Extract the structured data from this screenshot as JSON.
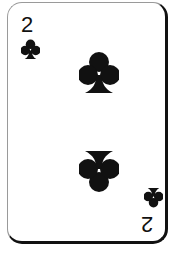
{
  "card": {
    "rank": "2",
    "suit": "clubs",
    "suit_color": "#111111"
  }
}
